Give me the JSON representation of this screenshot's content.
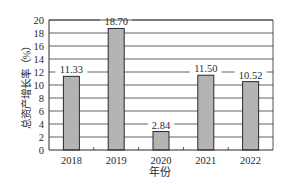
{
  "chart_data": {
    "type": "bar",
    "title": "",
    "categories": [
      "2018",
      "2019",
      "2020",
      "2021",
      "2022"
    ],
    "values": [
      11.33,
      18.7,
      2.84,
      11.5,
      10.52
    ],
    "value_labels": [
      "11.33",
      "18.70",
      "2.84",
      "11.50",
      "10.52"
    ],
    "xlabel": "年份",
    "ylabel": "总资产增长率（%）",
    "ylim": [
      0,
      20
    ],
    "yticks": [
      0,
      2,
      4,
      6,
      8,
      10,
      12,
      14,
      16,
      18,
      20
    ],
    "grid": true,
    "legend": null,
    "bar_color": "#b4b4b4",
    "bar_edge_color": "#2a2a2a",
    "grid_color": "#3a3a3a"
  }
}
